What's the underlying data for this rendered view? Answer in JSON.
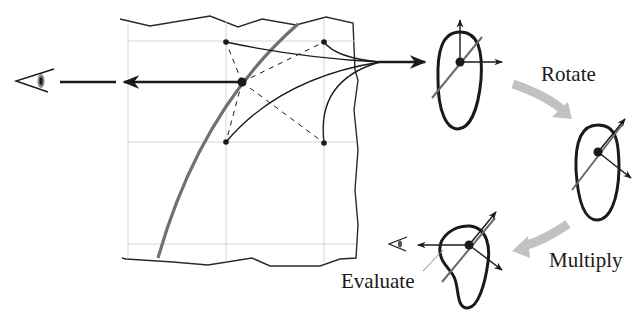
{
  "labels": {
    "rotate": "Rotate",
    "multiply": "Multiply",
    "evaluate": "Evaluate"
  },
  "colors": {
    "ink": "#1a1a1a",
    "grid": "#d4d4d4",
    "curve_gray": "#707070",
    "step_arrow": "#c2c2c2",
    "axis_gray": "#6a6a6a"
  },
  "diagram": {
    "panel": "grid-surface-patch",
    "grid_points": 4,
    "sample_point": "center",
    "stages": [
      "lobe-original",
      "lobe-rotated",
      "lobe-multiplied"
    ],
    "viewer_icons": [
      "eye-icon-large",
      "eye-icon-small"
    ]
  }
}
